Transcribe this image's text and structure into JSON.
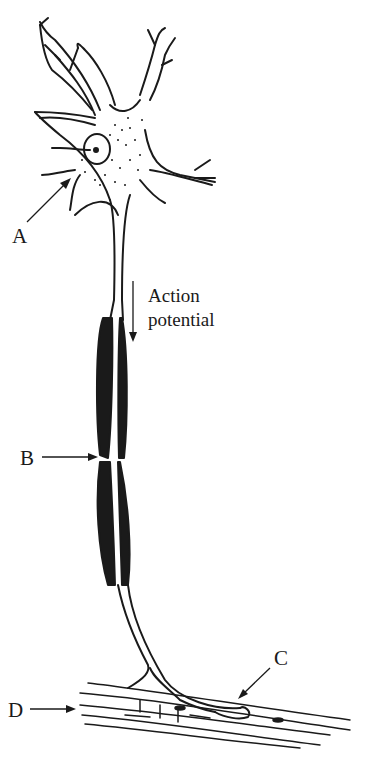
{
  "diagram": {
    "labels": {
      "A": "A",
      "B": "B",
      "C": "C",
      "D": "D"
    },
    "annotation": {
      "line1": "Action",
      "line2": "potential"
    },
    "parts": [
      {
        "label": "A",
        "points_to": "cell body"
      },
      {
        "label": "B",
        "points_to": "gap in myelin sheath"
      },
      {
        "label": "C",
        "points_to": "axon terminal on muscle"
      },
      {
        "label": "D",
        "points_to": "muscle fiber"
      }
    ],
    "colors": {
      "ink": "#1a1a1a",
      "background": "#ffffff"
    }
  }
}
